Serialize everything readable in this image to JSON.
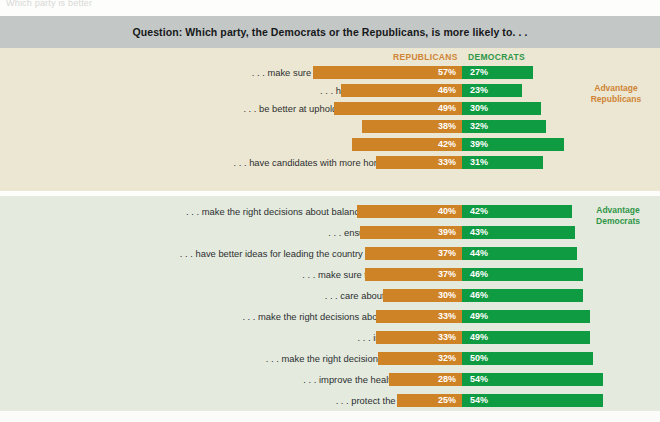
{
  "page": {
    "cropped_top_text": "Which party is better",
    "question": "Question: Which party, the Democrats or the Republicans, is more likely to. . ."
  },
  "legend": {
    "republicans": "REPUBLICANS",
    "democrats": "DEMOCRATS",
    "republican_color": "#cf8327",
    "democrat_color": "#0f9b42"
  },
  "callouts": {
    "republican_line1": "Advantage",
    "republican_line2": "Republicans",
    "democrat_line1": "Advantage",
    "democrat_line2": "Democrats"
  },
  "chart_data": {
    "type": "bar",
    "title": "Question: Which party, the Democrats or the Republicans, is more likely to. . .",
    "orientation": "horizontal-diverging",
    "xlabel": "",
    "ylabel": "",
    "unit": "%",
    "grid": false,
    "legend_position": "top-center",
    "series": [
      {
        "name": "REPUBLICANS",
        "color": "#cf8327",
        "direction": "left"
      },
      {
        "name": "DEMOCRATS",
        "color": "#0f9b42",
        "direction": "right"
      }
    ],
    "groups": [
      {
        "advantage": "Republicans",
        "background": "#ece7d2",
        "categories": [
          ". . . make sure U.S. military defenses are strong?",
          ". . . have high ethical standards?",
          ". . . be better at upholding traditional family values?",
          ". . . reduce crime?",
          ". . . reduce taxes?",
          ". . . have candidates with more honesty and integrity?"
        ],
        "republicans": [
          57,
          46,
          49,
          38,
          42,
          33
        ],
        "democrats": [
          27,
          23,
          30,
          32,
          39,
          31
        ],
        "republican_labels": [
          "57%",
          "46%",
          "49%",
          "38%",
          "42%",
          "33%"
        ],
        "democrat_labels": [
          "27%",
          "23%",
          "30%",
          "32%",
          "39%",
          "31%"
        ]
      },
      {
        "advantage": "Democrats",
        "background": "#e4eade",
        "categories": [
          ". . . make the right decisions about balancing the federal budget?",
          ". . . ensure a strong economy?",
          ". . . have better ideas for leading the country into the 21st century?",
          ". . . make sure the tax system is fair?",
          ". . . care about people like you?",
          ". . . make the right decisions about Social Security?",
          ". . . improve education?",
          ". . . make the right decisions about Medicare?",
          ". . . improve the health-care system?",
          ". . . protect the environment?"
        ],
        "republicans": [
          40,
          39,
          37,
          37,
          30,
          33,
          33,
          32,
          28,
          25
        ],
        "democrats": [
          42,
          43,
          44,
          46,
          46,
          49,
          49,
          50,
          54,
          54
        ],
        "republican_labels": [
          "40%",
          "39%",
          "37%",
          "37%",
          "30%",
          "33%",
          "33%",
          "32%",
          "28%",
          "25%"
        ],
        "democrat_labels": [
          "42%",
          "43%",
          "44%",
          "46%",
          "46%",
          "49%",
          "49%",
          "50%",
          "54%",
          "54%"
        ]
      }
    ]
  }
}
